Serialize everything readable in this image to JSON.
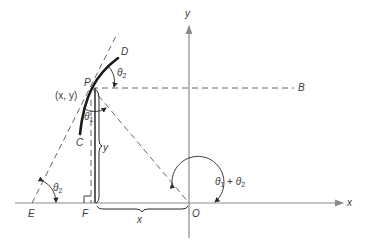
{
  "diagram": {
    "colors": {
      "line": "#2a2a2a",
      "axis": "#8a8a8a",
      "dashed": "#555555",
      "text": "#3a3a3a"
    },
    "axes": {
      "x_label": "x",
      "y_label": "y",
      "origin_label": "O"
    },
    "points": {
      "P": "P",
      "P_coords": "(x, y)",
      "B": "B",
      "C": "C",
      "D": "D",
      "E": "E",
      "F": "F"
    },
    "lengths": {
      "vertical": "y",
      "horizontal": "x"
    },
    "angles": {
      "theta": "θ",
      "sub1": "1",
      "sub2": "2",
      "plus": " + "
    }
  }
}
